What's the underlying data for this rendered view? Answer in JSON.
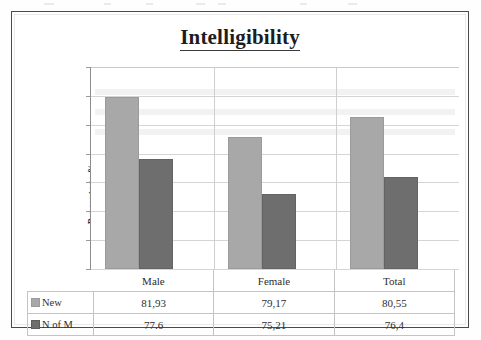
{
  "chart_data": {
    "type": "bar",
    "title": "Intelligibility",
    "xlabel": "",
    "ylabel": "Percentage %",
    "ylim": [
      70,
      84
    ],
    "ytick_step": 2,
    "yticks": [
      "84",
      "82",
      "80",
      "78",
      "76",
      "74",
      "72",
      "70"
    ],
    "grid": true,
    "legend_position": "data-table",
    "categories": [
      "Male",
      "Female",
      "Total"
    ],
    "series": [
      {
        "name": "New",
        "color": "#a8a8a8",
        "values": [
          81.93,
          79.17,
          80.55
        ],
        "labels": [
          "81,93",
          "79,17",
          "80,55"
        ]
      },
      {
        "name": "N of M",
        "color": "#6e6e6e",
        "values": [
          77.6,
          75.21,
          76.4
        ],
        "labels": [
          "77.6",
          "75,21",
          "76,4"
        ]
      }
    ]
  },
  "table": {
    "header_blank": "",
    "category_headers": [
      "Male",
      "Female",
      "Total"
    ],
    "rows": [
      {
        "label": "New",
        "swatch": "series-new",
        "cells": [
          "81,93",
          "79,17",
          "80,55"
        ]
      },
      {
        "label": "N of M",
        "swatch": "series-nofm",
        "cells": [
          "77.6",
          "75,21",
          "76,4"
        ]
      }
    ]
  },
  "colors": {
    "series_new": "#a8a8a8",
    "series_nofm": "#6e6e6e",
    "frame": "#4b4b4b",
    "gridline": "#d5d5d5",
    "axis": "#8d8d8d"
  }
}
